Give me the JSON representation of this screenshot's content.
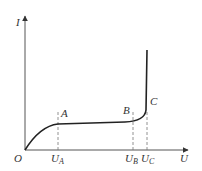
{
  "diagram": {
    "type": "I-U characteristic curve",
    "axes": {
      "y_label": "I",
      "x_label": "U",
      "origin_label": "O"
    },
    "points": [
      {
        "name": "A",
        "label": "A",
        "tick_main": "U",
        "tick_sub": "A"
      },
      {
        "name": "B",
        "label": "B",
        "tick_main": "U",
        "tick_sub": "B"
      },
      {
        "name": "C",
        "label": "C",
        "tick_main": "U",
        "tick_sub": "C"
      }
    ],
    "colors": {
      "axis": "#555555",
      "curve": "#222222",
      "dashed": "#777777",
      "text": "#333333"
    }
  }
}
